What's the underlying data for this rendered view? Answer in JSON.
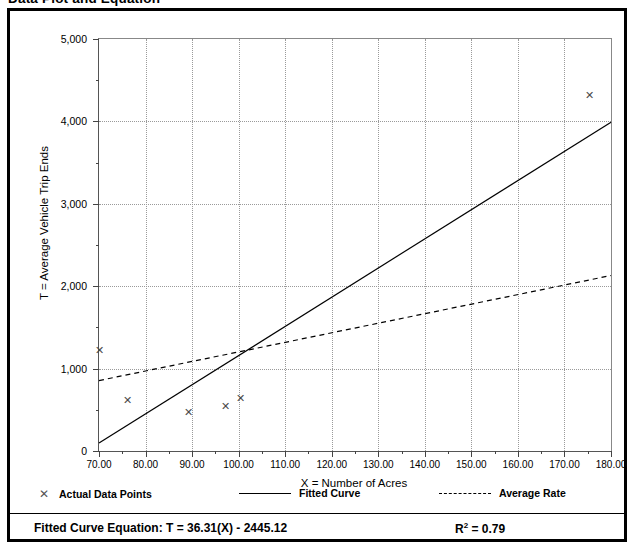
{
  "page_title": "Data Plot and Equation",
  "chart_data": {
    "type": "scatter",
    "title": "Data Plot and Equation",
    "xlabel": "X = Number of Acres",
    "ylabel": "T = Average Vehicle Trip Ends",
    "xlim": [
      70,
      180
    ],
    "ylim": [
      0,
      5000
    ],
    "grid": true,
    "x_ticks": [
      70,
      80,
      90,
      100,
      110,
      120,
      130,
      140,
      150,
      160,
      170,
      180
    ],
    "x_tick_labels": [
      "70.00",
      "80.00",
      "90.00",
      "100.00",
      "110.00",
      "120.00",
      "130.00",
      "140.00",
      "150.00",
      "160.00",
      "170.00",
      "180.00"
    ],
    "x_minor_ticks": [
      75,
      85,
      95,
      105,
      115,
      125,
      135,
      145,
      155,
      165,
      175
    ],
    "y_ticks": [
      0,
      1000,
      2000,
      3000,
      4000,
      5000
    ],
    "y_tick_labels": [
      "0",
      "1,000",
      "2,000",
      "3,000",
      "4,000",
      "5,000"
    ],
    "y_minor_ticks": [
      500,
      1500,
      2500,
      3500,
      4500
    ],
    "legend_position": "below-plot",
    "series": [
      {
        "name": "Actual Data Points",
        "type": "scatter",
        "marker": "x",
        "color": "#4a4a4a",
        "points": [
          {
            "x": 70.0,
            "y": 1225
          },
          {
            "x": 76.2,
            "y": 610
          },
          {
            "x": 89.3,
            "y": 465
          },
          {
            "x": 97.2,
            "y": 535
          },
          {
            "x": 100.5,
            "y": 640
          },
          {
            "x": 175.3,
            "y": 4320
          }
        ]
      },
      {
        "name": "Fitted Curve",
        "type": "line",
        "style": "solid",
        "color": "#000000",
        "equation": "T = 36.31(X) - 2445.12",
        "endpoints": [
          {
            "x": 70,
            "y": 96
          },
          {
            "x": 180,
            "y": 3991
          }
        ]
      },
      {
        "name": "Average Rate",
        "type": "line",
        "style": "dashed",
        "color": "#000000",
        "endpoints": [
          {
            "x": 70,
            "y": 855
          },
          {
            "x": 180,
            "y": 2130
          }
        ]
      }
    ]
  },
  "legend": {
    "items": [
      {
        "label": "Actual Data Points",
        "marker": "x"
      },
      {
        "label": "Fitted Curve",
        "marker": "solid-line"
      },
      {
        "label": "Average Rate",
        "marker": "dashed-line"
      }
    ]
  },
  "equation_row": {
    "equation_label": "Fitted Curve Equation:  T = 36.31(X) - 2445.12",
    "r_squared_prefix": "R",
    "r_squared_sup": "2",
    "r_squared_value": " = 0.79"
  }
}
